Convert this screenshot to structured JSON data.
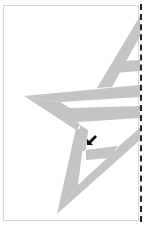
{
  "canvas": {
    "width": 151,
    "height": 225,
    "background": "#ffffff",
    "frame_border_color": "#d6d6d6"
  },
  "artwork": {
    "shape": "star-with-stripes",
    "fill_color": "#c4c4c4",
    "stripe_color": "#ffffff"
  },
  "page_edge": {
    "style": "dashed",
    "color": "#222222"
  },
  "cursor": {
    "type": "arrow-pointer",
    "direction": "down-left",
    "color": "#111111"
  }
}
